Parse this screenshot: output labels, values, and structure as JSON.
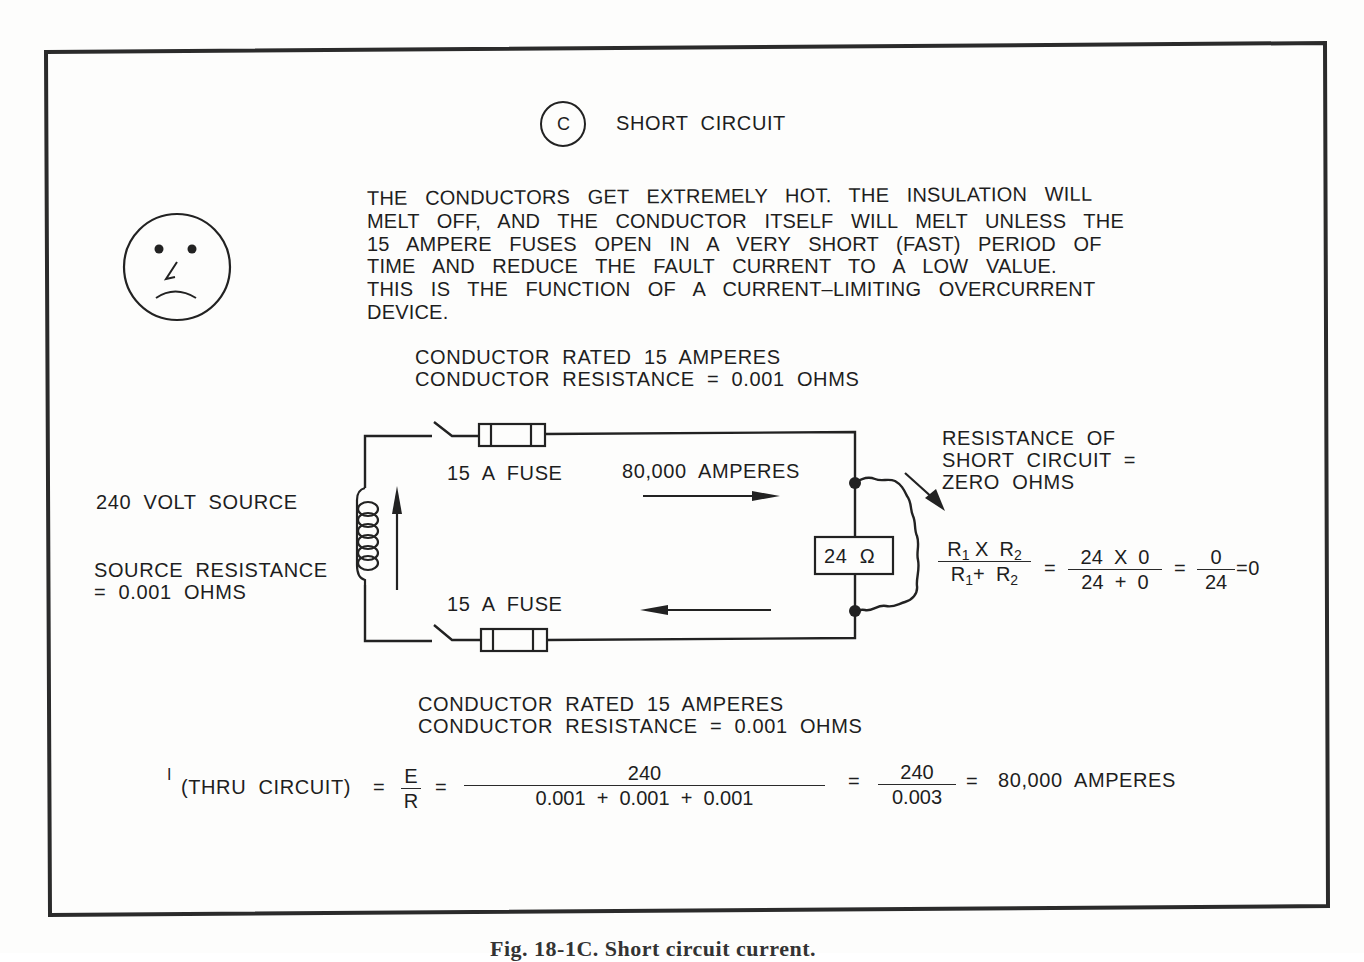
{
  "figure": {
    "circle_label": "C",
    "title": "SHORT  CIRCUIT",
    "description_lines": [
      "THE  CONDUCTORS  GET  EXTREMELY  HOT.  THE  INSULATION  WILL",
      "MELT  OFF,  AND  THE  CONDUCTOR  ITSELF  WILL  MELT  UNLESS  THE",
      "15  AMPERE  FUSES  OPEN  IN  A  VERY  SHORT  (FAST)  PERIOD  OF",
      "TIME  AND  REDUCE  THE  FAULT  CURRENT  TO  A  LOW  VALUE.",
      "THIS  IS  THE  FUNCTION  OF  A  CURRENT–LIMITING  OVERCURRENT",
      "DEVICE."
    ],
    "face_icon": "sad-face-icon",
    "top_conductor": {
      "rating": "CONDUCTOR  RATED  15  AMPERES",
      "resistance": "CONDUCTOR  RESISTANCE  =  0.001  OHMS"
    },
    "bottom_conductor": {
      "rating": "CONDUCTOR  RATED  15  AMPERES",
      "resistance": "CONDUCTOR  RESISTANCE  =  0.001  OHMS"
    },
    "source": {
      "label": "240  VOLT  SOURCE",
      "resistance_line1": "SOURCE  RESISTANCE",
      "resistance_line2": "=  0.001  OHMS"
    },
    "fuse_top_label": "15  A  FUSE",
    "fuse_bottom_label": "15  A  FUSE",
    "current_label": "80,000  AMPERES",
    "load_label": "24  Ω",
    "short_circuit_note": {
      "line1": "RESISTANCE  OF",
      "line2": "SHORT  CIRCUIT  =",
      "line3": "ZERO  OHMS"
    },
    "parallel_formula": {
      "num_a": "R",
      "sub1": "1",
      "x": " X  ",
      "num_b": "R",
      "sub2": "2",
      "den_a": "R",
      "den_sub1": "1",
      "plus": "+  ",
      "den_b": "R",
      "den_sub2": "2",
      "eq1": "=",
      "frac2_num": "24  X  0",
      "frac2_den": "24  +  0",
      "eq2": "=",
      "frac3_num": "0",
      "frac3_den": "24",
      "result": "=0"
    },
    "current_formula": {
      "i_label": "I",
      "subscript": "(THRU  CIRCUIT)",
      "eq1": "=",
      "e": "E",
      "r": "R",
      "eq2": "=",
      "frac_num": "240",
      "frac_den": "0.001  +  0.001  +  0.001",
      "eq3": "=",
      "frac2_num": "240",
      "frac2_den": "0.003",
      "eq4": "=",
      "result": "80,000  AMPERES"
    },
    "caption": "Fig. 18-1C.  Short circuit current."
  }
}
